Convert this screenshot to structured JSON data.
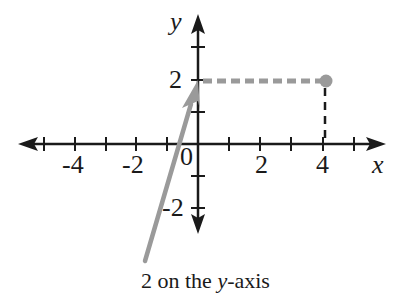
{
  "diagram": {
    "type": "coordinate-plane",
    "axes": {
      "x_label": "x",
      "y_label": "y",
      "x_tick_labels": [
        {
          "value": -4,
          "text": "-4"
        },
        {
          "value": -2,
          "text": "-2"
        },
        {
          "value": 0,
          "text": "0"
        },
        {
          "value": 2,
          "text": "2"
        },
        {
          "value": 4,
          "text": "4"
        }
      ],
      "y_tick_labels": [
        {
          "value": 2,
          "text": "2"
        },
        {
          "value": -2,
          "text": "-2"
        }
      ],
      "x_range": [
        -5,
        5
      ],
      "y_range": [
        -2,
        3
      ]
    },
    "point": {
      "x": 4,
      "y": 2,
      "color": "#9a9a9a"
    },
    "annotation": {
      "prefix": "2 on the ",
      "italic": "y",
      "suffix": "-axis",
      "arrow_color": "#9a9a9a"
    },
    "colors": {
      "axis": "#1a1a1a",
      "highlight": "#9a9a9a"
    }
  }
}
